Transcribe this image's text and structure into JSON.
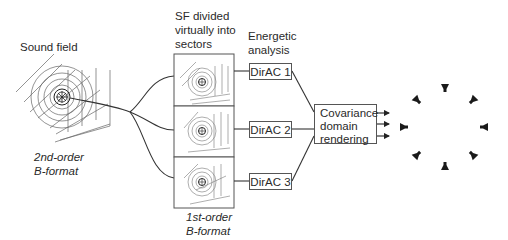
{
  "labels": {
    "sound_field": "Sound field",
    "sf_divided": [
      "SF divided",
      "virtually into",
      "sectors"
    ],
    "energetic_analysis": [
      "Energetic",
      "analysis"
    ],
    "second_order": [
      "2nd-order",
      "B-format"
    ],
    "first_order": [
      "1st-order",
      "B-format"
    ]
  },
  "dirac_blocks": [
    {
      "label": "DirAC 1"
    },
    {
      "label": "DirAC 2"
    },
    {
      "label": "DirAC 3"
    }
  ],
  "renderer": {
    "lines": [
      "Covariance",
      "domain",
      "rendering"
    ]
  },
  "outputs": {
    "arrow_count": 3,
    "loudspeaker_count": 8
  },
  "colors": {
    "line": "#333333",
    "light_line": "#888888",
    "speaker": "#1a1a1a"
  }
}
